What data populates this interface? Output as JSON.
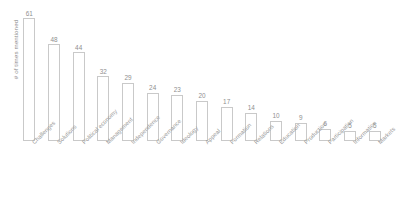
{
  "chart_data": {
    "type": "bar",
    "title": "",
    "subtitle": "",
    "xlabel": "",
    "ylabel": "# of times mentioned",
    "ylim": [
      0,
      61
    ],
    "grid": false,
    "legend": null,
    "orientation": "vertical",
    "data_labels": true,
    "categories": [
      "Challenges",
      "Solutions",
      "Political economy",
      "Management",
      "Independence",
      "Governance",
      "Ideology",
      "Appeal",
      "Formation",
      "Relations",
      "Education",
      "Production",
      "Participation",
      "Information",
      "Markets"
    ],
    "values": [
      61,
      48,
      44,
      32,
      29,
      24,
      23,
      20,
      17,
      14,
      10,
      9,
      6,
      5,
      5
    ],
    "colors": {
      "bar_outline": "#c9c9c9",
      "bar_fill": "#ffffff",
      "label_text": "#8f8f8f",
      "axis_text": "#9a9a9a",
      "background": "#ffffff"
    }
  }
}
